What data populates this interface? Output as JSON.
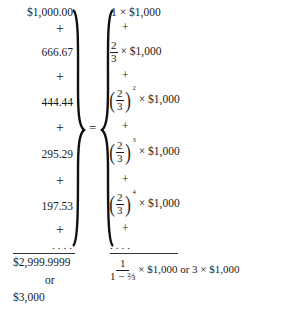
{
  "left_column": {
    "terms": [
      "$1,000.00",
      "666.67",
      "444.44",
      "295.29",
      "197.53"
    ],
    "plus": "+",
    "ellipsis": "....",
    "total": "$2,999.9999",
    "or_label": "or",
    "rounded_total": "$3,000"
  },
  "equals": "=",
  "right_column": {
    "term1": {
      "coef": "1",
      "times": "×",
      "amount": "$1,000"
    },
    "term2": {
      "num": "2",
      "den": "3",
      "times": "×",
      "amount": "$1,000"
    },
    "term3": {
      "num": "2",
      "den": "3",
      "exp": "2",
      "times": "×",
      "amount": "$1,000"
    },
    "term4": {
      "num": "2",
      "den": "3",
      "exp": "3",
      "times": "×",
      "amount": "$1,000"
    },
    "term5": {
      "num": "2",
      "den": "3",
      "exp": "4",
      "times": "×",
      "amount": "$1,000"
    },
    "plus": "+",
    "ellipsis": "....",
    "sum_formula": {
      "numerator": "1",
      "denominator_prefix": "1 − ",
      "denominator_frac": "⅔",
      "times": "×",
      "amount": "$1,000",
      "or_label": "or",
      "alt": "3 × $1,000"
    }
  }
}
